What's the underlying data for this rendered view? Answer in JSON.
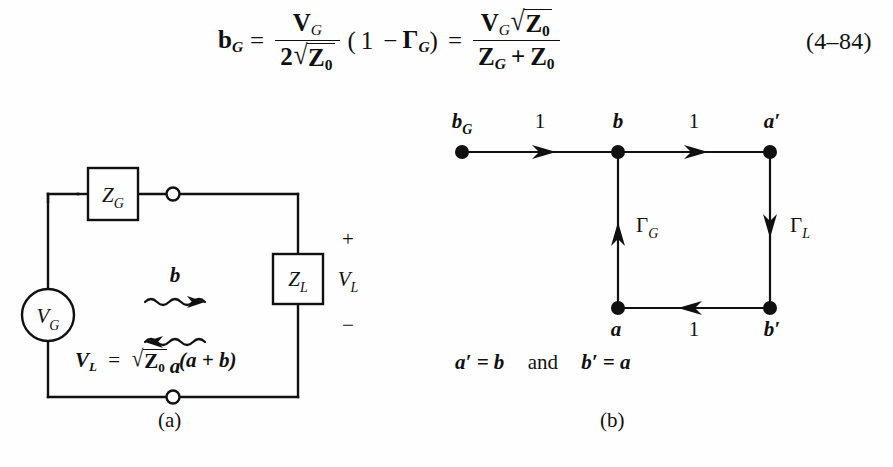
{
  "equation": {
    "number": "(4–84)",
    "lhs": "b",
    "lhs_sub": "G",
    "eq1": "=",
    "frac1": {
      "num_main": "V",
      "num_sub": "G",
      "den_coef": "2",
      "den_radicand": "Z",
      "den_radicand_sub": "0"
    },
    "paren_open": "(",
    "one": "1",
    "minus": "−",
    "gamma": "Γ",
    "gamma_sub": "G",
    "paren_close": ")",
    "eq2": "=",
    "frac2": {
      "num_main": "V",
      "num_sub": "G",
      "num_radicand": "Z",
      "num_radicand_sub": "0",
      "den_left": "Z",
      "den_left_sub": "G",
      "den_plus": "+",
      "den_right": "Z",
      "den_right_sub": "0"
    },
    "sqrt_glyph": "√"
  },
  "figure_a": {
    "name": "circuit-schematic",
    "source_label": "V",
    "source_sub": "G",
    "generator_impedance": "Z",
    "generator_impedance_sub": "G",
    "load_impedance": "Z",
    "load_impedance_sub": "L",
    "wave_forward_label": "b",
    "wave_reverse_label": "a",
    "plus_sign": "+",
    "minus_sign": "−",
    "load_voltage": "V",
    "load_voltage_sub": "L",
    "caption": {
      "lhs": "V",
      "lhs_sub": "L",
      "eq": "=",
      "radicand": "Z",
      "radicand_sub": "0",
      "rhs": "(a + b)"
    },
    "sublabel": "(a)"
  },
  "figure_b": {
    "name": "signal-flow-graph",
    "nodes": [
      {
        "id": "bG",
        "label": "b",
        "sub": "G",
        "x": 462,
        "y": 152,
        "label_x": 455,
        "label_y": 112
      },
      {
        "id": "b",
        "label": "b",
        "sub": "",
        "x": 618,
        "y": 152,
        "label_x": 612,
        "label_y": 112
      },
      {
        "id": "aprime",
        "label": "a′",
        "sub": "",
        "x": 770,
        "y": 152,
        "label_x": 762,
        "label_y": 112
      },
      {
        "id": "a",
        "label": "a",
        "sub": "",
        "x": 618,
        "y": 308,
        "label_x": 612,
        "label_y": 318
      },
      {
        "id": "bprime",
        "label": "b′",
        "sub": "",
        "x": 770,
        "y": 308,
        "label_x": 762,
        "label_y": 318
      }
    ],
    "edges": [
      {
        "from": "bG",
        "to": "b",
        "weight": "1",
        "weight_sub": "",
        "label_x": 533,
        "label_y": 112,
        "direction": "right"
      },
      {
        "from": "b",
        "to": "aprime",
        "weight": "1",
        "weight_sub": "",
        "label_x": 690,
        "label_y": 112,
        "direction": "right"
      },
      {
        "from": "aprime",
        "to": "bprime",
        "weight": "Γ",
        "weight_sub": "L",
        "label_x": 785,
        "label_y": 216,
        "direction": "down"
      },
      {
        "from": "bprime",
        "to": "a",
        "weight": "1",
        "weight_sub": "",
        "label_x": 690,
        "label_y": 318,
        "direction": "left"
      },
      {
        "from": "a",
        "to": "b",
        "weight": "Γ",
        "weight_sub": "G",
        "label_x": 632,
        "label_y": 216,
        "direction": "up"
      }
    ],
    "caption": {
      "left": "a′ = b",
      "conjunction": "and",
      "right": "b′ = a"
    },
    "sublabel": "(b)"
  },
  "style": {
    "ink": "#101010",
    "paper": "#fefefe",
    "stroke_width": 2.4
  }
}
